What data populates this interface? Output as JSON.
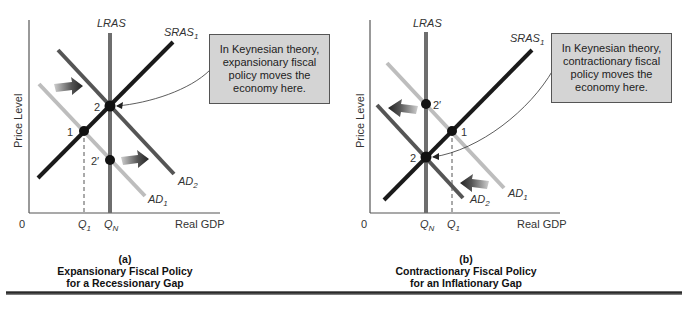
{
  "panels": [
    {
      "id": "a",
      "y_axis_label": "Price Level",
      "x_axis_label": "Real GDP",
      "origin_label": "0",
      "curves": {
        "lras": {
          "label": "LRAS"
        },
        "sras": {
          "label": "SRAS",
          "subscript": "1"
        },
        "ad1": {
          "label": "AD",
          "subscript": "1"
        },
        "ad2": {
          "label": "AD",
          "subscript": "2"
        }
      },
      "points": [
        {
          "label": "1"
        },
        {
          "label": "2"
        },
        {
          "label": "2′"
        }
      ],
      "x_ticks": [
        {
          "label": "Q",
          "subscript": "1"
        },
        {
          "label": "Q",
          "subscript": "N"
        }
      ],
      "callout": "In Keynesian theory, expansionary fiscal policy moves the economy here.",
      "caption_letter": "(a)",
      "caption_line1": "Expansionary Fiscal Policy",
      "caption_line2": "for a Recessionary Gap",
      "arrow_direction": "right"
    },
    {
      "id": "b",
      "y_axis_label": "Price Level",
      "x_axis_label": "Real GDP",
      "origin_label": "0",
      "curves": {
        "lras": {
          "label": "LRAS"
        },
        "sras": {
          "label": "SRAS",
          "subscript": "1"
        },
        "ad1": {
          "label": "AD",
          "subscript": "1"
        },
        "ad2": {
          "label": "AD",
          "subscript": "2"
        }
      },
      "points": [
        {
          "label": "1"
        },
        {
          "label": "2"
        },
        {
          "label": "2′"
        }
      ],
      "x_ticks": [
        {
          "label": "Q",
          "subscript": "N"
        },
        {
          "label": "Q",
          "subscript": "1"
        }
      ],
      "callout": "In Keynesian theory, contractionary fiscal policy moves the economy here.",
      "caption_letter": "(b)",
      "caption_line1": "Contractionary Fiscal Policy",
      "caption_line2": "for an Inflationary Gap",
      "arrow_direction": "left"
    }
  ],
  "colors": {
    "lras": "#6e6e6e",
    "sras": "#1a1a1a",
    "ad1": "#bdbdbd",
    "ad2": "#555555",
    "callout_bg": "#d4d4d4",
    "point": "#111111"
  }
}
